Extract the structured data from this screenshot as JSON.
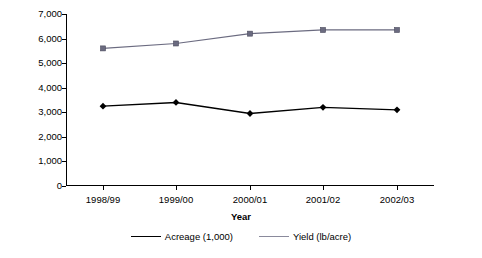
{
  "chart_data": {
    "type": "line",
    "title": "",
    "xlabel": "Year",
    "ylabel": "",
    "categories": [
      "1998/99",
      "1999/00",
      "2000/01",
      "2001/02",
      "2002/03"
    ],
    "ylim": [
      0,
      7000
    ],
    "yticks": [
      "0",
      "1,000",
      "2,000",
      "3,000",
      "4,000",
      "5,000",
      "6,000",
      "7,000"
    ],
    "ytick_values": [
      0,
      1000,
      2000,
      3000,
      4000,
      5000,
      6000,
      7000
    ],
    "grid": false,
    "legend_position": "bottom",
    "series": [
      {
        "name": "Acreage (1,000)",
        "marker": "diamond",
        "color": "#000000",
        "values": [
          3250,
          3400,
          2950,
          3200,
          3100
        ]
      },
      {
        "name": "Yield (lb/acre)",
        "marker": "square",
        "color": "#6b6b80",
        "values": [
          5600,
          5800,
          6200,
          6350,
          6350
        ]
      }
    ]
  },
  "legend": {
    "items": [
      {
        "label": "Acreage (1,000)"
      },
      {
        "label": "Yield (lb/acre)"
      }
    ]
  }
}
